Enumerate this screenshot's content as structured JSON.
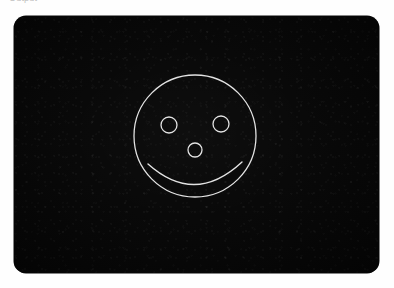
{
  "page": {
    "background_color": "#fefefe",
    "width": 394,
    "height": 288
  },
  "caption": {
    "text": "Output",
    "color": "#8d8d8d",
    "clipped": "true"
  },
  "board": {
    "name": "dark-drawing-board",
    "background_color": "#070707",
    "corner_radius": 12,
    "left": 14,
    "top": 16,
    "width": 365,
    "height": 257
  },
  "drawing": {
    "name": "smiley-face",
    "stroke_color": "#e2e2e2",
    "parts": {
      "face": {
        "label": "face-outline-circle",
        "cx": 181,
        "cy": 120,
        "r": 61,
        "stroke_width": 1.3
      },
      "left_eye": {
        "label": "left-eye-circle",
        "cx": 155,
        "cy": 109,
        "r": 8,
        "stroke_width": 1.3
      },
      "right_eye": {
        "label": "right-eye-circle",
        "cx": 207,
        "cy": 108,
        "r": 8,
        "stroke_width": 1.3
      },
      "nose": {
        "label": "nose-circle",
        "cx": 181,
        "cy": 134,
        "r": 7,
        "stroke_width": 1.3
      },
      "mouth": {
        "label": "smile-arc",
        "path": "M 134 148 Q 181 190 228 146",
        "stroke_width": 1.4
      }
    }
  }
}
